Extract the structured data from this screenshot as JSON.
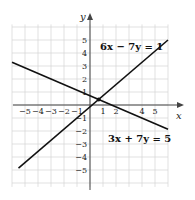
{
  "chart_data": {
    "type": "line",
    "title": "",
    "xlabel": "x",
    "ylabel": "y",
    "xlim": [
      -6,
      6
    ],
    "ylim": [
      -6,
      6
    ],
    "grid": true,
    "x_ticks": [
      "-5",
      "-4",
      "-3",
      "-2",
      "-1",
      "1",
      "2",
      "4",
      "5"
    ],
    "y_ticks": [
      "5",
      "4",
      "3",
      "2",
      "1",
      "-1",
      "-2",
      "-3",
      "-4",
      "-5"
    ],
    "series": [
      {
        "name": "6x − 7y = 1",
        "equation": "6x - 7y = 1",
        "points": [
          [
            -5.5,
            -4.86
          ],
          [
            6,
            5
          ]
        ]
      },
      {
        "name": "3x + 7y = 5",
        "equation": "3x + 7y = 5",
        "points": [
          [
            -6,
            3.29
          ],
          [
            6,
            -1.86
          ]
        ]
      }
    ],
    "annotations": [
      {
        "text": "6x − 7y = 1",
        "position": [
          1.5,
          4.2
        ]
      },
      {
        "text": "3x + 7y = 5",
        "position": [
          1.5,
          -2.5
        ]
      }
    ],
    "intersection": [
      0.67,
      0.43
    ]
  },
  "labels": {
    "x_axis": "x",
    "y_axis": "y",
    "eq1": "6x − 7y = 1",
    "eq2": "3x + 7y = 5"
  },
  "ticks": {
    "x": [
      {
        "v": -5,
        "t": "−5"
      },
      {
        "v": -4,
        "t": "−4"
      },
      {
        "v": -3,
        "t": "−3"
      },
      {
        "v": -2,
        "t": "−2"
      },
      {
        "v": -1,
        "t": "−1"
      },
      {
        "v": 1,
        "t": "1"
      },
      {
        "v": 2,
        "t": "2"
      },
      {
        "v": 4,
        "t": "4"
      },
      {
        "v": 5,
        "t": "5"
      }
    ],
    "y": [
      {
        "v": 5,
        "t": "5"
      },
      {
        "v": 4,
        "t": "4"
      },
      {
        "v": 3,
        "t": "3"
      },
      {
        "v": 2,
        "t": "2"
      },
      {
        "v": 1,
        "t": "1"
      },
      {
        "v": -1,
        "t": "−1"
      },
      {
        "v": -2,
        "t": "−2"
      },
      {
        "v": -3,
        "t": "−3"
      },
      {
        "v": -4,
        "t": "−4"
      },
      {
        "v": -5,
        "t": "−5"
      }
    ]
  }
}
